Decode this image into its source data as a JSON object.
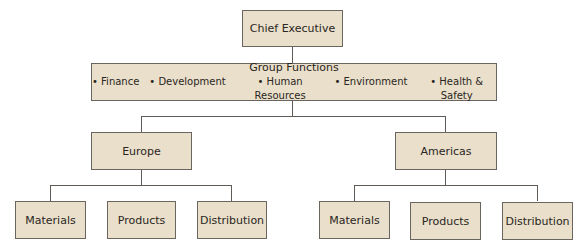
{
  "chart": {
    "root": {
      "label": "Chief Executive"
    },
    "group_functions": {
      "title": "Group Functions",
      "items": [
        "Finance",
        "Development",
        "Human Resources",
        "Environment",
        "Health & Safety"
      ]
    },
    "regions": [
      {
        "label": "Europe",
        "children": [
          "Materials",
          "Products",
          "Distribution"
        ]
      },
      {
        "label": "Americas",
        "children": [
          "Materials",
          "Products",
          "Distribution"
        ]
      }
    ]
  }
}
